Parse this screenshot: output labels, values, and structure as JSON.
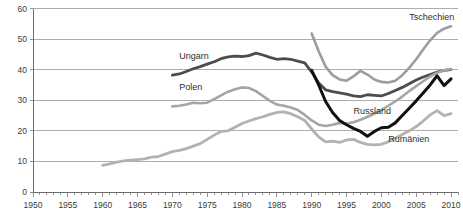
{
  "chart_data": {
    "type": "line",
    "title": "",
    "xlabel": "",
    "ylabel": "",
    "xlim": [
      1950,
      2011
    ],
    "ylim": [
      0,
      60
    ],
    "grid": true,
    "legend_position": "inline-labels",
    "y_ticks": [
      0,
      10,
      20,
      30,
      40,
      50,
      60
    ],
    "x_ticks": [
      1950,
      1955,
      1960,
      1965,
      1970,
      1975,
      1980,
      1985,
      1990,
      1995,
      2000,
      2005,
      2010
    ],
    "x_minor_tick_step": 1,
    "series": [
      {
        "name": "Tschechien",
        "color": "#9d9d9d",
        "width": 2.6,
        "label_x": 2004,
        "label_y": 56.2,
        "points": [
          [
            1990,
            51.8
          ],
          [
            1991,
            46.0
          ],
          [
            1992,
            41.0
          ],
          [
            1993,
            38.2
          ],
          [
            1994,
            36.8
          ],
          [
            1995,
            36.4
          ],
          [
            1996,
            37.8
          ],
          [
            1997,
            39.6
          ],
          [
            1998,
            38.4
          ],
          [
            1999,
            36.8
          ],
          [
            2000,
            36.0
          ],
          [
            2001,
            35.8
          ],
          [
            2002,
            36.4
          ],
          [
            2003,
            38.2
          ],
          [
            2004,
            40.6
          ],
          [
            2005,
            43.4
          ],
          [
            2006,
            46.6
          ],
          [
            2007,
            49.6
          ],
          [
            2008,
            52.0
          ],
          [
            2009,
            53.4
          ],
          [
            2010,
            54.2
          ]
        ]
      },
      {
        "name": "Ungarn",
        "color": "#4c4c4c",
        "width": 2.8,
        "label_x": 1971,
        "label_y": 43.4,
        "points": [
          [
            1970,
            38.2
          ],
          [
            1971,
            38.6
          ],
          [
            1972,
            39.4
          ],
          [
            1973,
            40.3
          ],
          [
            1974,
            41.0
          ],
          [
            1975,
            41.8
          ],
          [
            1976,
            42.6
          ],
          [
            1977,
            43.6
          ],
          [
            1978,
            44.2
          ],
          [
            1979,
            44.4
          ],
          [
            1980,
            44.3
          ],
          [
            1981,
            44.6
          ],
          [
            1982,
            45.4
          ],
          [
            1983,
            44.8
          ],
          [
            1984,
            44.0
          ],
          [
            1985,
            43.4
          ],
          [
            1986,
            43.6
          ],
          [
            1987,
            43.4
          ],
          [
            1988,
            42.8
          ],
          [
            1989,
            42.2
          ],
          [
            1990,
            39.2
          ],
          [
            1991,
            35.6
          ],
          [
            1992,
            33.4
          ],
          [
            1993,
            32.8
          ],
          [
            1994,
            32.4
          ],
          [
            1995,
            32.0
          ],
          [
            1996,
            31.4
          ],
          [
            1997,
            31.2
          ],
          [
            1998,
            31.8
          ],
          [
            1999,
            31.6
          ],
          [
            2000,
            31.4
          ],
          [
            2001,
            32.2
          ],
          [
            2002,
            33.2
          ],
          [
            2003,
            34.2
          ],
          [
            2004,
            35.4
          ],
          [
            2005,
            36.6
          ],
          [
            2006,
            37.6
          ],
          [
            2007,
            38.4
          ],
          [
            2008,
            39.2
          ],
          [
            2009,
            39.8
          ],
          [
            2010,
            40.0
          ]
        ]
      },
      {
        "name": "Polen",
        "color": "#a5a5a5",
        "width": 2.6,
        "label_x": 1971,
        "label_y": 33.2,
        "points": [
          [
            1970,
            28.0
          ],
          [
            1971,
            28.2
          ],
          [
            1972,
            28.6
          ],
          [
            1973,
            29.2
          ],
          [
            1974,
            29.0
          ],
          [
            1975,
            29.2
          ],
          [
            1976,
            30.4
          ],
          [
            1977,
            31.6
          ],
          [
            1978,
            32.8
          ],
          [
            1979,
            33.6
          ],
          [
            1980,
            34.2
          ],
          [
            1981,
            34.0
          ],
          [
            1982,
            33.0
          ],
          [
            1983,
            31.4
          ],
          [
            1984,
            29.8
          ],
          [
            1985,
            28.6
          ],
          [
            1986,
            28.2
          ],
          [
            1987,
            27.6
          ],
          [
            1988,
            26.8
          ],
          [
            1989,
            25.2
          ],
          [
            1990,
            23.4
          ],
          [
            1991,
            22.0
          ],
          [
            1992,
            21.6
          ],
          [
            1993,
            22.0
          ],
          [
            1994,
            22.6
          ],
          [
            1995,
            22.4
          ],
          [
            1996,
            22.8
          ],
          [
            1997,
            23.6
          ],
          [
            1998,
            24.6
          ],
          [
            1999,
            25.6
          ],
          [
            2000,
            26.8
          ],
          [
            2001,
            28.2
          ],
          [
            2002,
            29.6
          ],
          [
            2003,
            31.2
          ],
          [
            2004,
            33.0
          ],
          [
            2005,
            34.6
          ],
          [
            2006,
            36.2
          ],
          [
            2007,
            37.8
          ],
          [
            2008,
            39.0
          ],
          [
            2009,
            39.8
          ],
          [
            2010,
            40.2
          ]
        ]
      },
      {
        "name": "Russland",
        "color": "#111111",
        "width": 3.0,
        "label_x": 1996,
        "label_y": 25.6,
        "points": [
          [
            1990,
            39.8
          ],
          [
            1991,
            35.0
          ],
          [
            1992,
            29.6
          ],
          [
            1993,
            26.0
          ],
          [
            1994,
            23.4
          ],
          [
            1995,
            22.0
          ],
          [
            1996,
            20.8
          ],
          [
            1997,
            19.8
          ],
          [
            1998,
            18.2
          ],
          [
            1999,
            19.8
          ],
          [
            2000,
            21.0
          ],
          [
            2001,
            21.2
          ],
          [
            2002,
            22.6
          ],
          [
            2003,
            25.0
          ],
          [
            2004,
            27.4
          ],
          [
            2005,
            29.8
          ],
          [
            2006,
            32.4
          ],
          [
            2007,
            35.0
          ],
          [
            2008,
            38.0
          ],
          [
            2009,
            34.8
          ],
          [
            2010,
            37.0
          ]
        ]
      },
      {
        "name": "Rumänien",
        "color": "#b2b2b2",
        "width": 2.8,
        "label_x": 2001,
        "label_y": 16.4,
        "points": [
          [
            1960,
            8.7
          ],
          [
            1961,
            9.2
          ],
          [
            1962,
            9.8
          ],
          [
            1963,
            10.2
          ],
          [
            1964,
            10.4
          ],
          [
            1965,
            10.6
          ],
          [
            1966,
            10.8
          ],
          [
            1967,
            11.4
          ],
          [
            1968,
            11.6
          ],
          [
            1969,
            12.4
          ],
          [
            1970,
            13.2
          ],
          [
            1971,
            13.6
          ],
          [
            1972,
            14.2
          ],
          [
            1973,
            15.0
          ],
          [
            1974,
            15.8
          ],
          [
            1975,
            17.2
          ],
          [
            1976,
            18.6
          ],
          [
            1977,
            19.8
          ],
          [
            1978,
            20.0
          ],
          [
            1979,
            21.2
          ],
          [
            1980,
            22.4
          ],
          [
            1981,
            23.2
          ],
          [
            1982,
            24.0
          ],
          [
            1983,
            24.6
          ],
          [
            1984,
            25.4
          ],
          [
            1985,
            26.0
          ],
          [
            1986,
            26.2
          ],
          [
            1987,
            25.6
          ],
          [
            1988,
            24.6
          ],
          [
            1989,
            23.4
          ],
          [
            1990,
            20.6
          ],
          [
            1991,
            18.0
          ],
          [
            1992,
            16.4
          ],
          [
            1993,
            16.6
          ],
          [
            1994,
            16.2
          ],
          [
            1995,
            17.0
          ],
          [
            1996,
            17.2
          ],
          [
            1997,
            16.2
          ],
          [
            1998,
            15.6
          ],
          [
            1999,
            15.4
          ],
          [
            2000,
            15.6
          ],
          [
            2001,
            16.4
          ],
          [
            2002,
            17.6
          ],
          [
            2003,
            18.8
          ],
          [
            2004,
            20.0
          ],
          [
            2005,
            21.4
          ],
          [
            2006,
            23.2
          ],
          [
            2007,
            25.2
          ],
          [
            2008,
            26.6
          ],
          [
            2009,
            25.0
          ],
          [
            2010,
            25.6
          ]
        ]
      }
    ]
  }
}
